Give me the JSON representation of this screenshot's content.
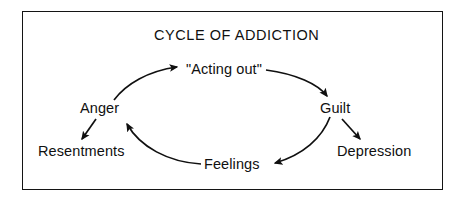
{
  "diagram": {
    "title": "CYCLE OF ADDICTION",
    "type": "cycle-flow-diagram",
    "frame": {
      "border_color": "#141414",
      "background_color": "#ffffff"
    },
    "text_color": "#101010",
    "nodes": {
      "acting_out": "\"Acting out\"",
      "guilt": "Guilt",
      "feelings": "Feelings",
      "anger": "Anger",
      "resentments": "Resentments",
      "depression": "Depression"
    },
    "cycle_order": [
      "Anger",
      "\"Acting out\"",
      "Guilt",
      "Feelings"
    ],
    "branches": [
      {
        "from": "Anger",
        "to": "Resentments"
      },
      {
        "from": "Guilt",
        "to": "Depression"
      }
    ],
    "arrows": [
      {
        "from": "Anger",
        "to": "\"Acting out\"",
        "style": "curved"
      },
      {
        "from": "\"Acting out\"",
        "to": "Guilt",
        "style": "curved"
      },
      {
        "from": "Guilt",
        "to": "Feelings",
        "style": "curved"
      },
      {
        "from": "Feelings",
        "to": "Anger",
        "style": "curved"
      },
      {
        "from": "Anger",
        "to": "Resentments",
        "style": "straight"
      },
      {
        "from": "Guilt",
        "to": "Depression",
        "style": "straight"
      }
    ]
  }
}
